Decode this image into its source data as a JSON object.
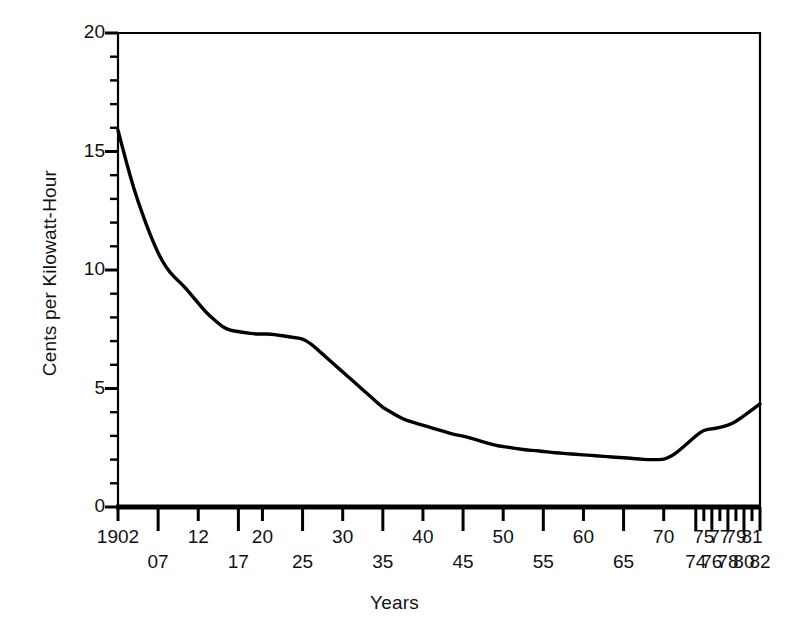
{
  "chart_data": {
    "type": "line",
    "title": "",
    "xlabel": "Years",
    "ylabel": "Cents per Kilowatt-Hour",
    "xlim": [
      1902,
      1982
    ],
    "ylim": [
      0,
      20
    ],
    "grid": false,
    "legend": "none",
    "y_ticks_major": [
      0,
      5,
      10,
      15,
      20
    ],
    "y_ticks_major_labels": [
      "0",
      "5",
      "10",
      "15",
      "20"
    ],
    "y_ticks_minor_step": 1,
    "x_tick_years": [
      1902,
      1907,
      1912,
      1917,
      1920,
      1925,
      1930,
      1935,
      1940,
      1945,
      1950,
      1955,
      1960,
      1965,
      1970,
      1974,
      1975,
      1976,
      1977,
      1978,
      1979,
      1980,
      1981,
      1982
    ],
    "x_tick_labels_upper": [
      "1902",
      "12",
      "20",
      "30",
      "40",
      "50",
      "60",
      "70",
      "75",
      "77",
      "79",
      "81"
    ],
    "x_tick_labels_lower": [
      "07",
      "17",
      "25",
      "35",
      "45",
      "55",
      "65",
      "74",
      "76",
      "78",
      "80",
      "82"
    ],
    "x_tick_label_rows": [
      {
        "label": "1902",
        "year": 1902,
        "row": "upper"
      },
      {
        "label": "07",
        "year": 1907,
        "row": "lower"
      },
      {
        "label": "12",
        "year": 1912,
        "row": "upper"
      },
      {
        "label": "17",
        "year": 1917,
        "row": "lower"
      },
      {
        "label": "20",
        "year": 1920,
        "row": "upper"
      },
      {
        "label": "25",
        "year": 1925,
        "row": "lower"
      },
      {
        "label": "30",
        "year": 1930,
        "row": "upper"
      },
      {
        "label": "35",
        "year": 1935,
        "row": "lower"
      },
      {
        "label": "40",
        "year": 1940,
        "row": "upper"
      },
      {
        "label": "45",
        "year": 1945,
        "row": "lower"
      },
      {
        "label": "50",
        "year": 1950,
        "row": "upper"
      },
      {
        "label": "55",
        "year": 1955,
        "row": "lower"
      },
      {
        "label": "60",
        "year": 1960,
        "row": "upper"
      },
      {
        "label": "65",
        "year": 1965,
        "row": "lower"
      },
      {
        "label": "70",
        "year": 1970,
        "row": "upper"
      },
      {
        "label": "74",
        "year": 1974,
        "row": "lower"
      },
      {
        "label": "75",
        "year": 1975,
        "row": "upper"
      },
      {
        "label": "76",
        "year": 1976,
        "row": "lower"
      },
      {
        "label": "77",
        "year": 1977,
        "row": "upper"
      },
      {
        "label": "78",
        "year": 1978,
        "row": "lower"
      },
      {
        "label": "79",
        "year": 1979,
        "row": "upper"
      },
      {
        "label": "80",
        "year": 1980,
        "row": "lower"
      },
      {
        "label": "81",
        "year": 1981,
        "row": "upper"
      },
      {
        "label": "82",
        "year": 1982,
        "row": "lower"
      }
    ],
    "series": [
      {
        "name": "Cost of electricity",
        "color": "#000000",
        "x": [
          1902,
          1903,
          1904,
          1905,
          1906,
          1907,
          1908,
          1909,
          1910,
          1911,
          1912,
          1913,
          1914,
          1915,
          1916,
          1917,
          1918,
          1919,
          1920,
          1921,
          1922,
          1923,
          1924,
          1925,
          1926,
          1927,
          1928,
          1929,
          1930,
          1931,
          1932,
          1933,
          1934,
          1935,
          1936,
          1937,
          1938,
          1939,
          1940,
          1941,
          1942,
          1943,
          1944,
          1945,
          1946,
          1947,
          1948,
          1949,
          1950,
          1951,
          1952,
          1953,
          1954,
          1955,
          1956,
          1957,
          1958,
          1959,
          1960,
          1961,
          1962,
          1963,
          1964,
          1965,
          1966,
          1967,
          1968,
          1969,
          1970,
          1971,
          1972,
          1973,
          1974,
          1975,
          1976,
          1977,
          1978,
          1979,
          1980,
          1981,
          1982
        ],
        "y": [
          15.9,
          14.6,
          13.4,
          12.4,
          11.5,
          10.7,
          10.1,
          9.7,
          9.4,
          9.0,
          8.6,
          8.2,
          7.9,
          7.6,
          7.45,
          7.4,
          7.35,
          7.3,
          7.3,
          7.3,
          7.25,
          7.2,
          7.15,
          7.1,
          6.9,
          6.6,
          6.3,
          6.0,
          5.7,
          5.4,
          5.1,
          4.8,
          4.5,
          4.2,
          4.0,
          3.8,
          3.65,
          3.55,
          3.45,
          3.35,
          3.25,
          3.15,
          3.05,
          3.0,
          2.9,
          2.8,
          2.7,
          2.6,
          2.55,
          2.5,
          2.45,
          2.4,
          2.38,
          2.35,
          2.3,
          2.28,
          2.25,
          2.22,
          2.2,
          2.18,
          2.15,
          2.12,
          2.1,
          2.08,
          2.05,
          2.02,
          2.0,
          2.0,
          2.0,
          2.15,
          2.4,
          2.7,
          3.0,
          3.25,
          3.3,
          3.35,
          3.45,
          3.6,
          3.85,
          4.1,
          4.35
        ]
      }
    ],
    "series_points_readable": [
      {
        "year": 1902,
        "value": 15.9
      },
      {
        "year": 1907,
        "value": 10.7
      },
      {
        "year": 1912,
        "value": 8.6
      },
      {
        "year": 1917,
        "value": 7.4
      },
      {
        "year": 1920,
        "value": 7.3
      },
      {
        "year": 1925,
        "value": 7.1
      },
      {
        "year": 1930,
        "value": 5.7
      },
      {
        "year": 1935,
        "value": 4.2
      },
      {
        "year": 1940,
        "value": 3.45
      },
      {
        "year": 1945,
        "value": 3.0
      },
      {
        "year": 1950,
        "value": 2.55
      },
      {
        "year": 1955,
        "value": 2.35
      },
      {
        "year": 1960,
        "value": 2.2
      },
      {
        "year": 1965,
        "value": 2.08
      },
      {
        "year": 1970,
        "value": 2.0
      },
      {
        "year": 1974,
        "value": 3.0
      },
      {
        "year": 1975,
        "value": 3.25
      },
      {
        "year": 1976,
        "value": 3.3
      },
      {
        "year": 1977,
        "value": 3.35
      },
      {
        "year": 1978,
        "value": 3.45
      },
      {
        "year": 1979,
        "value": 3.6
      },
      {
        "year": 1980,
        "value": 3.85
      },
      {
        "year": 1981,
        "value": 4.1
      },
      {
        "year": 1982,
        "value": 4.35
      }
    ]
  }
}
